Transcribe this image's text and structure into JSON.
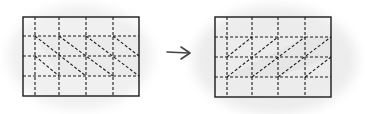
{
  "diagram": {
    "colors": {
      "line": "#1a1a1a",
      "shade": "#e6e6e6",
      "background": "#ffffff"
    },
    "arrow_icon": "right-arrow-icon",
    "left_grid": {
      "x": 23,
      "y": 17,
      "width": 116,
      "height": 79,
      "vertical_lines_x": [
        35,
        59,
        86,
        113
      ],
      "horizontal_lines_y": [
        36,
        56,
        76
      ],
      "diagonal_direction": "top-left to bottom-right"
    },
    "right_grid": {
      "x": 215,
      "y": 17,
      "width": 116,
      "height": 80,
      "vertical_lines_x": [
        227,
        252,
        278,
        305
      ],
      "horizontal_lines_y": [
        37,
        57,
        77
      ],
      "diagonal_direction": "bottom-left to top-right"
    }
  }
}
